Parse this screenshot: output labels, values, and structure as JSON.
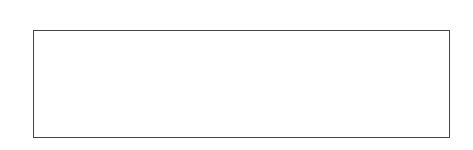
{
  "chart_data": {
    "type": "heatmap",
    "xlabel": "",
    "ylabel": "",
    "colormap": "gray",
    "n_rows": 12,
    "n_cols": 48,
    "x_ticks": [
      0,
      10,
      20,
      30,
      40
    ],
    "y_ticks": [
      0,
      2,
      4,
      6,
      8,
      10
    ],
    "xlim": [
      -0.5,
      47.5
    ],
    "ylim": [
      11.5,
      -0.5
    ],
    "x_axis_position": "top",
    "values": [
      [
        108,
        106,
        105,
        104,
        106,
        105,
        104,
        106,
        105,
        107,
        104,
        106,
        105,
        104,
        106,
        107,
        105,
        104,
        106,
        105,
        104,
        106,
        105,
        107,
        106,
        104,
        105,
        106,
        104,
        105,
        106,
        104,
        105,
        106,
        104,
        105,
        106,
        107,
        105,
        104,
        106,
        105,
        104,
        106,
        105,
        104,
        106,
        105
      ],
      [
        140,
        138,
        142,
        136,
        140,
        145,
        138,
        130,
        140,
        138,
        136,
        142,
        134,
        132,
        140,
        138,
        136,
        140,
        130,
        138,
        142,
        136,
        140,
        138,
        132,
        136,
        130,
        132,
        138,
        140,
        134,
        128,
        132,
        140,
        144,
        138,
        132,
        134,
        128,
        136,
        140,
        132,
        136,
        142,
        130,
        128,
        134,
        138
      ],
      [
        200,
        190,
        198,
        205,
        192,
        188,
        195,
        185,
        190,
        195,
        198,
        192,
        188,
        200,
        194,
        186,
        190,
        196,
        192,
        188,
        195,
        190,
        186,
        194,
        188,
        182,
        186,
        175,
        180,
        184,
        178,
        186,
        176,
        170,
        182,
        178,
        186,
        172,
        176,
        180,
        182,
        170,
        178,
        175,
        168,
        160,
        165,
        172
      ],
      [
        150,
        160,
        140,
        120,
        118,
        150,
        160,
        152,
        145,
        130,
        148,
        155,
        140,
        118,
        140,
        150,
        142,
        125,
        138,
        146,
        150,
        140,
        130,
        128,
        120,
        132,
        120,
        140,
        150,
        145,
        132,
        130,
        95,
        140,
        135,
        148,
        128,
        118,
        150,
        155,
        138,
        130,
        140,
        165,
        150,
        120,
        138,
        150
      ],
      [
        130,
        110,
        145,
        130,
        95,
        115,
        130,
        138,
        125,
        112,
        120,
        130,
        118,
        110,
        130,
        125,
        118,
        112,
        132,
        125,
        110,
        100,
        128,
        115,
        100,
        120,
        118,
        95,
        110,
        100,
        108,
        125,
        140,
        130,
        118,
        100,
        110,
        128,
        150,
        140,
        120,
        98,
        120,
        140,
        155,
        130,
        108,
        135
      ],
      [
        95,
        90,
        98,
        92,
        88,
        96,
        100,
        92,
        98,
        95,
        90,
        94,
        100,
        96,
        88,
        92,
        96,
        90,
        98,
        100,
        95,
        92,
        88,
        96,
        90,
        82,
        88,
        80,
        92,
        95,
        88,
        86,
        90,
        98,
        92,
        88,
        96,
        92,
        88,
        94,
        98,
        90,
        86,
        92,
        88,
        84,
        90,
        96
      ],
      [
        70,
        115,
        140,
        120,
        110,
        128,
        118,
        98,
        155,
        120,
        125,
        118,
        110,
        130,
        100,
        128,
        120,
        135,
        145,
        125,
        108,
        112,
        150,
        120,
        128,
        100,
        118,
        110,
        105,
        145,
        128,
        132,
        120,
        148,
        112,
        98,
        110,
        130,
        120,
        152,
        115,
        100,
        95,
        120,
        135,
        118,
        80,
        110
      ],
      [
        110,
        160,
        130,
        118,
        108,
        128,
        112,
        100,
        125,
        130,
        98,
        108,
        160,
        140,
        115,
        120,
        148,
        130,
        125,
        110,
        128,
        160,
        125,
        108,
        80,
        118,
        130,
        125,
        110,
        100,
        135,
        150,
        128,
        108,
        120,
        125,
        110,
        95,
        130,
        108,
        118,
        130,
        125,
        105,
        110,
        140,
        132,
        120
      ],
      [
        90,
        130,
        120,
        100,
        110,
        108,
        95,
        88,
        112,
        130,
        110,
        100,
        118,
        120,
        88,
        125,
        130,
        118,
        100,
        115,
        108,
        88,
        110,
        125,
        120,
        100,
        85,
        98,
        110,
        120,
        100,
        80,
        110,
        125,
        108,
        88,
        100,
        120,
        130,
        110,
        100,
        125,
        115,
        70,
        112,
        125,
        100,
        95
      ],
      [
        110,
        98,
        100,
        110,
        95,
        100,
        88,
        92,
        108,
        96,
        100,
        110,
        98,
        92,
        100,
        96,
        110,
        100,
        92,
        85,
        100,
        110,
        98,
        88,
        112,
        100,
        92,
        110,
        100,
        96,
        88,
        100,
        112,
        98,
        100,
        92,
        108,
        96,
        100,
        95,
        92,
        110,
        98,
        100,
        108,
        96,
        90,
        100
      ],
      [
        112,
        130,
        128,
        120,
        100,
        92,
        110,
        95,
        70,
        85,
        90,
        75,
        98,
        100,
        88,
        108,
        120,
        100,
        115,
        95,
        110,
        75,
        90,
        100,
        118,
        130,
        125,
        110,
        120,
        102,
        118,
        80,
        112,
        120,
        98,
        110,
        132,
        108,
        95,
        120,
        100,
        105,
        128,
        135,
        85,
        100,
        110,
        125
      ],
      [
        140,
        115,
        150,
        152,
        130,
        125,
        140,
        128,
        100,
        110,
        140,
        128,
        150,
        130,
        125,
        145,
        140,
        138,
        155,
        150,
        130,
        65,
        130,
        145,
        140,
        150,
        120,
        138,
        150,
        128,
        140,
        160,
        130,
        148,
        155,
        120,
        140,
        165,
        150,
        138,
        130,
        150,
        160,
        140,
        120,
        145,
        155,
        150
      ]
    ]
  }
}
